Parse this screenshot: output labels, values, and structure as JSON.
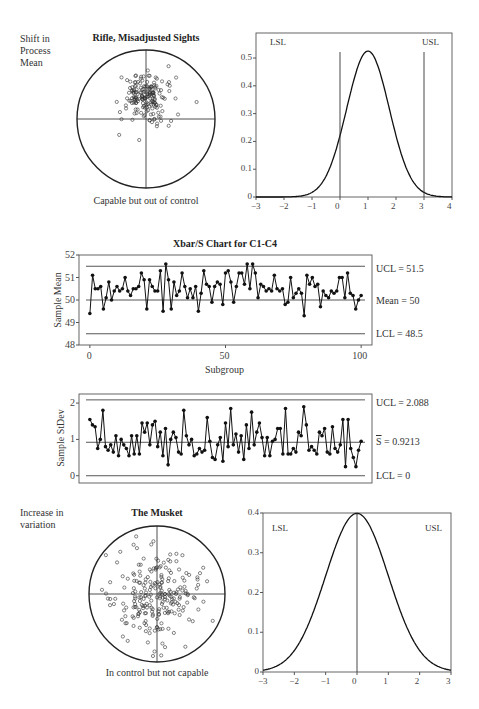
{
  "section_top": {
    "side_label": [
      "Shift in",
      "Process",
      "Mean"
    ],
    "target": {
      "title": "Rifle, Misadjusted Sights",
      "caption": "Capable but out of control",
      "center": [
        146,
        119
      ],
      "radius": 69,
      "shots": {
        "count": 180,
        "mean_dx": 0,
        "mean_dy": -22,
        "sd": 13,
        "seed": 7
      }
    },
    "normal_curve": {
      "lsl_label": "LSL",
      "usl_label": "USL"
    }
  },
  "section_middle": {
    "title": "Xbar/S Chart for C1-C4",
    "xbar": {
      "ylabel": "Sample Mean",
      "ucl_label": "UCL = 51.5",
      "mean_label": "Mean = 50",
      "lcl_label": "LCL = 48.5",
      "xlabel": "Subgroup"
    },
    "s": {
      "ylabel": "Sample StDev",
      "ucl_label": "UCL = 2.088",
      "mean_label": "S = 0.9213",
      "lcl_label": "LCL = 0"
    }
  },
  "section_bottom": {
    "side_label": [
      "Increase in",
      "variation"
    ],
    "target": {
      "title": "The Musket",
      "caption": "In control but not capable",
      "center": [
        157,
        594
      ],
      "radius": 68,
      "shots": {
        "count": 230,
        "mean_dx": 0,
        "mean_dy": 0,
        "sd": 22,
        "seed": 13
      }
    },
    "normal_curve": {
      "lsl_label": "LSL",
      "usl_label": "USL"
    }
  },
  "chart_data": [
    {
      "type": "line",
      "title": "Shift in process mean: normal density",
      "x_ticks": [
        -3,
        -2,
        -1,
        0,
        1,
        2,
        3,
        4
      ],
      "y_ticks": [
        0,
        0.1,
        0.2,
        0.3,
        0.4,
        0.5
      ],
      "xlim": [
        -3,
        4
      ],
      "ylim": [
        0,
        0.59
      ],
      "series": [
        {
          "name": "density",
          "distribution": "normal",
          "mean": 1,
          "sd": 0.76,
          "peak": 0.525
        }
      ],
      "reference_lines": [
        {
          "label": "LSL",
          "x": 0
        },
        {
          "label": "USL",
          "x": 3
        }
      ]
    },
    {
      "type": "line",
      "title": "Xbar/S Chart for C1-C4",
      "panel": "Xbar",
      "xlabel": "Subgroup",
      "ylabel": "Sample Mean",
      "x_ticks": [
        0,
        50,
        100
      ],
      "y_ticks": [
        48,
        49,
        50,
        51,
        52
      ],
      "xlim": [
        -4,
        104
      ],
      "ylim": [
        48,
        52
      ],
      "control_limits": {
        "UCL": 51.5,
        "Mean": 50,
        "LCL": 48.5
      },
      "series": [
        {
          "name": "Sample Mean",
          "values": [
            49.4,
            51.1,
            50.5,
            50.5,
            50.6,
            49.6,
            50.1,
            50.8,
            50.0,
            50.4,
            50.6,
            50.4,
            50.5,
            51.0,
            50.4,
            50.2,
            50.5,
            50.5,
            50.6,
            51.2,
            50.9,
            49.6,
            50.9,
            50.6,
            50.4,
            50.4,
            51.3,
            49.5,
            51.6,
            50.9,
            49.6,
            50.8,
            50.2,
            50.4,
            51.2,
            50.6,
            50.1,
            50.5,
            50.1,
            50.6,
            49.5,
            50.3,
            51.3,
            50.7,
            50.6,
            49.9,
            50.6,
            50.8,
            50.7,
            49.8,
            51.2,
            51.3,
            50.8,
            49.9,
            50.6,
            51.2,
            51.2,
            50.7,
            51.6,
            50.5,
            51.6,
            51.2,
            50.1,
            50.7,
            50.6,
            50.4,
            50.5,
            50.4,
            51.1,
            50.5,
            50.4,
            50.5,
            49.8,
            49.9,
            51.0,
            50.1,
            50.3,
            50.5,
            50.3,
            49.3,
            51.1,
            50.7,
            51.0,
            50.6,
            50.7,
            49.7,
            50.4,
            50.2,
            50.1,
            50.4,
            50.3,
            50.4,
            51.0,
            51.0,
            50.1,
            51.2,
            50.3,
            50.2,
            49.6,
            50.0,
            50.2
          ]
        }
      ]
    },
    {
      "type": "line",
      "title": "Xbar/S Chart for C1-C4",
      "panel": "S",
      "xlabel": "Subgroup",
      "ylabel": "Sample StDev",
      "y_ticks": [
        0,
        1,
        2
      ],
      "xlim": [
        -4,
        104
      ],
      "ylim": [
        -0.2,
        2.25
      ],
      "control_limits": {
        "UCL": 2.088,
        "S_bar": 0.9213,
        "LCL": 0
      },
      "series": [
        {
          "name": "Sample StDev",
          "values": [
            1.55,
            1.4,
            1.35,
            0.75,
            1.0,
            1.8,
            0.8,
            0.7,
            0.85,
            0.65,
            1.1,
            0.55,
            1.0,
            0.85,
            0.75,
            0.55,
            1.1,
            0.6,
            1.1,
            0.6,
            1.45,
            1.2,
            1.45,
            0.85,
            1.4,
            1.5,
            0.8,
            1.2,
            0.55,
            1.3,
            0.3,
            1.0,
            1.2,
            1.05,
            0.65,
            0.6,
            1.8,
            1.1,
            0.85,
            1.0,
            0.55,
            0.6,
            0.75,
            0.65,
            0.7,
            1.6,
            0.95,
            0.5,
            0.45,
            0.85,
            1.05,
            0.4,
            1.45,
            0.8,
            1.85,
            0.85,
            1.15,
            0.65,
            1.1,
            0.45,
            1.4,
            0.75,
            1.75,
            0.85,
            1.2,
            1.45,
            1.05,
            0.55,
            1.05,
            0.55,
            0.95,
            1.0,
            1.3,
            1.3,
            0.6,
            1.85,
            0.6,
            0.6,
            0.75,
            0.65,
            1.2,
            1.1,
            1.9,
            1.4,
            0.7,
            0.8,
            0.7,
            0.6,
            1.2,
            1.1,
            1.3,
            0.65,
            0.6,
            1.35,
            0.75,
            0.65,
            0.85,
            1.55,
            0.25,
            1.55,
            0.75,
            0.5,
            0.25,
            0.7,
            0.95
          ]
        }
      ]
    },
    {
      "type": "line",
      "title": "Increase in variation: normal density",
      "x_ticks": [
        -3,
        -2,
        -1,
        0,
        1,
        2,
        3
      ],
      "y_ticks": [
        0,
        0.1,
        0.2,
        0.3,
        0.4
      ],
      "xlim": [
        -3,
        3
      ],
      "ylim": [
        0,
        0.4
      ],
      "series": [
        {
          "name": "density",
          "distribution": "normal",
          "mean": 0,
          "sd": 1,
          "peak": 0.399
        }
      ],
      "reference_lines": [
        {
          "label": "center",
          "x": 0
        }
      ]
    }
  ]
}
